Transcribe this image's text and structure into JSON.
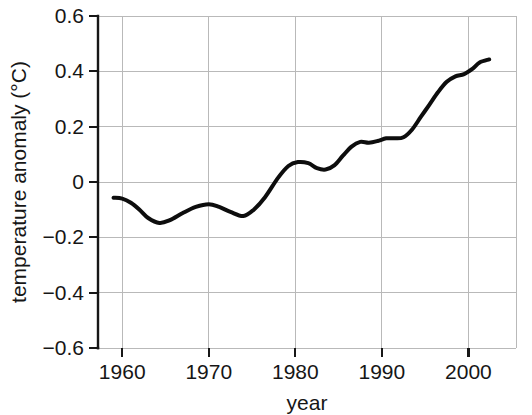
{
  "chart_data": {
    "type": "line",
    "title": "",
    "xlabel": "year",
    "ylabel": "temperature anomaly (°C)",
    "xlim": [
      1957.2,
      2005.5
    ],
    "ylim": [
      -0.6,
      0.6
    ],
    "xticks": [
      1960,
      1970,
      1980,
      1990,
      2000
    ],
    "xtick_labels": [
      "1960",
      "1970",
      "1980",
      "1990",
      "2000"
    ],
    "yticks": [
      0.6,
      0.4,
      0.2,
      0,
      -0.2,
      -0.4,
      -0.6
    ],
    "ytick_labels": [
      "0.6",
      "0.4",
      "0.2",
      "0",
      "−0.2",
      "−0.4",
      "−0.6"
    ],
    "grid": true,
    "legend": false,
    "legend_position": "none",
    "line_color": "#0d0d0d",
    "grid_color": "#b9b9b9",
    "axis_color": "#171717",
    "series": [
      {
        "name": "temperature anomaly",
        "x": [
          1959.0,
          1960.0,
          1961.0,
          1962.0,
          1963.0,
          1964.3,
          1965.5,
          1967.0,
          1968.5,
          1970.0,
          1971.2,
          1972.5,
          1974.0,
          1975.2,
          1976.5,
          1978.0,
          1979.2,
          1980.3,
          1981.5,
          1982.5,
          1983.5,
          1984.5,
          1985.5,
          1986.5,
          1987.5,
          1988.5,
          1989.5,
          1990.5,
          1991.5,
          1992.5,
          1993.5,
          1994.5,
          1995.5,
          1996.5,
          1997.5,
          1998.5,
          1999.5,
          2000.5,
          2001.3,
          2002.4
        ],
        "y": [
          -0.057,
          -0.06,
          -0.075,
          -0.1,
          -0.13,
          -0.148,
          -0.138,
          -0.112,
          -0.09,
          -0.08,
          -0.09,
          -0.108,
          -0.123,
          -0.1,
          -0.055,
          0.015,
          0.058,
          0.072,
          0.068,
          0.05,
          0.045,
          0.06,
          0.095,
          0.128,
          0.145,
          0.142,
          0.148,
          0.158,
          0.158,
          0.162,
          0.19,
          0.235,
          0.28,
          0.325,
          0.362,
          0.382,
          0.39,
          0.41,
          0.432,
          0.443
        ]
      }
    ]
  },
  "axis_labels": {
    "x_title": "year",
    "y_title": "temperature anomaly (°C)"
  }
}
